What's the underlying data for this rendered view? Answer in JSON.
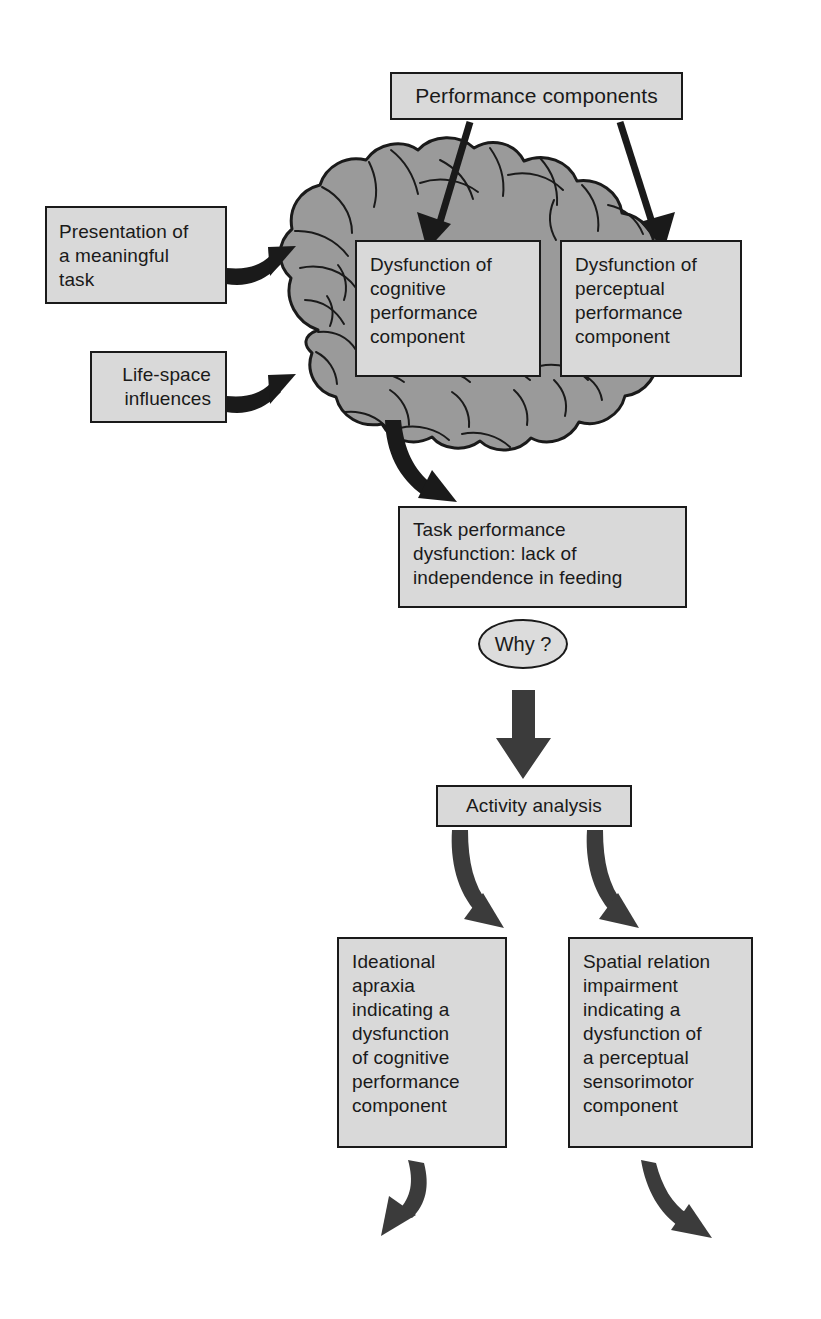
{
  "diagram": {
    "colors": {
      "brain_fill": "#9a9a9a",
      "box_fill": "#d9d9d9",
      "ellipse_fill": "#dcdcdc",
      "stroke": "#1a1a1a",
      "background": "#ffffff"
    }
  },
  "nodes": {
    "performance_components": "Performance components",
    "presentation_task": "Presentation of\na meaningful\ntask",
    "life_space": "Life-space\ninfluences",
    "dysfunction_cognitive": "Dysfunction of\ncognitive\nperformance\ncomponent",
    "dysfunction_perceptual": "Dysfunction of\nperceptual\nperformance\ncomponent",
    "task_dysfunction": "Task performance\ndysfunction: lack of\nindependence in feeding",
    "why": "Why ?",
    "activity_analysis": "Activity analysis",
    "ideational_apraxia": "Ideational\napraxia\nindicating a\ndysfunction\nof cognitive\nperformance\ncomponent",
    "spatial_relation": "Spatial relation\nimpairment\nindicating a\ndysfunction of\na perceptual\nsensorimotor\ncomponent"
  },
  "edges": [
    {
      "id": "perf-to-cognitive",
      "from": "performance_components",
      "to": "dysfunction_cognitive",
      "style": "straight-arrow"
    },
    {
      "id": "perf-to-perceptual",
      "from": "performance_components",
      "to": "dysfunction_perceptual",
      "style": "straight-arrow"
    },
    {
      "id": "presentation-to-brain",
      "from": "presentation_task",
      "to": "brain",
      "style": "curved-arrow"
    },
    {
      "id": "lifespace-to-brain",
      "from": "life_space",
      "to": "brain",
      "style": "curved-arrow"
    },
    {
      "id": "brain-to-task",
      "from": "brain",
      "to": "task_dysfunction",
      "style": "curved-arrow"
    },
    {
      "id": "why-to-activity",
      "from": "why",
      "to": "activity_analysis",
      "style": "block-arrow"
    },
    {
      "id": "activity-to-ideational",
      "from": "activity_analysis",
      "to": "ideational_apraxia",
      "style": "curved-arrow"
    },
    {
      "id": "activity-to-spatial",
      "from": "activity_analysis",
      "to": "spatial_relation",
      "style": "curved-arrow"
    },
    {
      "id": "ideational-out",
      "from": "ideational_apraxia",
      "to": "",
      "style": "curved-arrow"
    },
    {
      "id": "spatial-out",
      "from": "spatial_relation",
      "to": "",
      "style": "curved-arrow"
    }
  ],
  "illustration": {
    "brain": "brain-illustration"
  }
}
